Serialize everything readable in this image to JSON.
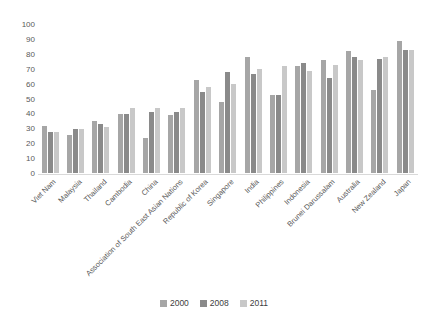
{
  "chart_data": {
    "type": "bar",
    "title": "",
    "xlabel": "",
    "ylabel": "",
    "categories": [
      "Viet Nam",
      "Malaysia",
      "Thailand",
      "Cambodia",
      "China",
      "Association of South East Asian Nations",
      "Republic of Korea",
      "Singapore",
      "India",
      "Philippines",
      "Indonesia",
      "Brunei Darussalam",
      "Australia",
      "New Zealand",
      "Japan"
    ],
    "series": [
      {
        "name": "2000",
        "color": "#a6a6a6",
        "values": [
          32,
          26,
          35,
          40,
          24,
          39,
          63,
          48,
          78,
          53,
          72,
          76,
          82,
          56,
          89
        ]
      },
      {
        "name": "2008",
        "color": "#8a8a8a",
        "values": [
          28,
          30,
          33,
          40,
          41,
          41,
          55,
          68,
          67,
          53,
          74,
          64,
          78,
          77,
          83
        ]
      },
      {
        "name": "2011",
        "color": "#c8c8c8",
        "values": [
          28,
          30,
          31,
          44,
          44,
          44,
          58,
          60,
          70,
          72,
          69,
          73,
          76,
          78,
          83
        ]
      }
    ],
    "ylim": [
      0,
      100
    ],
    "yticks": [
      0,
      10,
      20,
      30,
      40,
      50,
      60,
      70,
      80,
      90,
      100
    ],
    "grid": false,
    "legend_position": "bottom"
  },
  "style_colors": {
    "tick_label": "#595959",
    "legend_label": "#404040",
    "axis_line": "#d9d9d9",
    "background": "#ffffff"
  }
}
